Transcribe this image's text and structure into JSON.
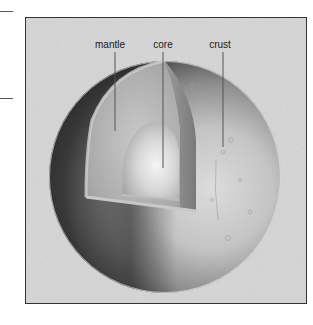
{
  "figure": {
    "labels": [
      {
        "id": "mantle",
        "text": "mantle"
      },
      {
        "id": "core",
        "text": "core"
      },
      {
        "id": "crust",
        "text": "crust"
      }
    ]
  },
  "colors": {
    "background": "#d6d6d6",
    "frame_border": "#333333",
    "leader_line": "#555555",
    "label_text": "#1a1a1a"
  }
}
